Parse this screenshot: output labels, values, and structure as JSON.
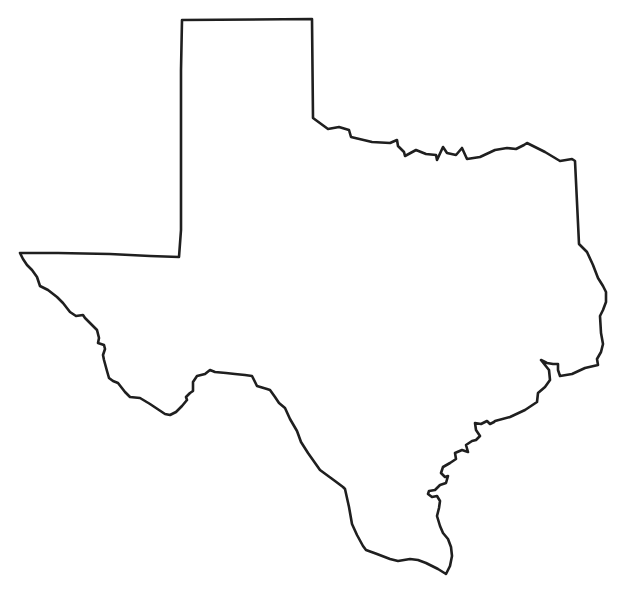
{
  "map": {
    "subject": "Texas state outline",
    "style": "blank outline, no labels",
    "stroke_color": "#1f1f1f",
    "fill_color": "#ffffff",
    "background_color": "#ffffff",
    "labels": []
  }
}
